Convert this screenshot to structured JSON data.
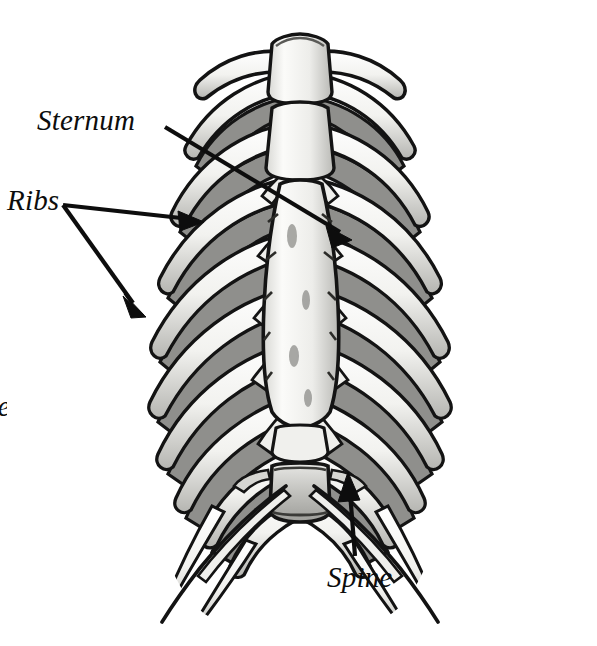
{
  "figure": {
    "style": "black-and-white pen-and-ink anatomical illustration with grayscale shading",
    "background_color": "#ffffff",
    "ink_color": "#111111",
    "bone_highlight_color": "#fbfbf8",
    "bone_shadow_color": "#9a9a9a",
    "bone_midtone_color": "#c9c9c6",
    "width": 597,
    "height": 646
  },
  "labels": {
    "sternum": "Sternum",
    "ribs": "Ribs",
    "spine": "Spine"
  },
  "edge_fragments": {
    "line1": "e",
    "line2": "r",
    "line3": "ne"
  },
  "leaders": [
    {
      "label": "Sternum",
      "from": [
        165,
        127
      ],
      "to": [
        346,
        236
      ],
      "arrowheads": 1
    },
    {
      "label": "Ribs",
      "from": [
        63,
        205
      ],
      "to": [
        196,
        222
      ],
      "arrowheads": 1
    },
    {
      "label": "Ribs",
      "from": [
        63,
        205
      ],
      "to": [
        140,
        310
      ],
      "arrowheads": 1
    },
    {
      "label": "Spine",
      "from": [
        355,
        556
      ],
      "to": [
        349,
        478
      ],
      "arrowheads": 1
    }
  ],
  "anatomy": {
    "structures": [
      "manubrium",
      "jugular notch",
      "sternal body",
      "xiphoid process",
      "clavicles",
      "true ribs 1-7",
      "false ribs 8-10",
      "floating ribs 11-12",
      "costal cartilage",
      "costal arch",
      "lumbar vertebra"
    ],
    "rib_pair_count": 12
  }
}
